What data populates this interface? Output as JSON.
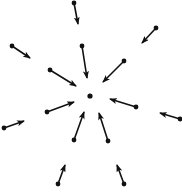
{
  "diagram": {
    "title": "",
    "colors": {
      "background": "#ffffff",
      "stroke": "#111111"
    },
    "center": {
      "x": 90,
      "y": 96,
      "r": 2.6
    },
    "arrows": [
      {
        "id": "top",
        "x1": 74,
        "y1": 3,
        "x2": 78,
        "y2": 24
      },
      {
        "id": "upper-left-outer",
        "x1": 12,
        "y1": 46,
        "x2": 30,
        "y2": 58
      },
      {
        "id": "upper-right-outer",
        "x1": 156,
        "y1": 28,
        "x2": 142,
        "y2": 43
      },
      {
        "id": "upper-inner",
        "x1": 82,
        "y1": 46,
        "x2": 87,
        "y2": 78
      },
      {
        "id": "upper-left-inner",
        "x1": 50,
        "y1": 70,
        "x2": 76,
        "y2": 86
      },
      {
        "id": "upper-right-inner",
        "x1": 124,
        "y1": 61,
        "x2": 103,
        "y2": 82
      },
      {
        "id": "right-inner",
        "x1": 136,
        "y1": 107,
        "x2": 110,
        "y2": 99
      },
      {
        "id": "right-outer",
        "x1": 180,
        "y1": 119,
        "x2": 160,
        "y2": 113
      },
      {
        "id": "left-inner",
        "x1": 47,
        "y1": 112,
        "x2": 74,
        "y2": 102
      },
      {
        "id": "left-outer",
        "x1": 4,
        "y1": 128,
        "x2": 24,
        "y2": 121
      },
      {
        "id": "lower-left-inner",
        "x1": 74,
        "y1": 140,
        "x2": 84,
        "y2": 112
      },
      {
        "id": "lower-right-inner",
        "x1": 108,
        "y1": 141,
        "x2": 99,
        "y2": 113
      },
      {
        "id": "bottom-left",
        "x1": 58,
        "y1": 184,
        "x2": 65,
        "y2": 165
      },
      {
        "id": "bottom-right",
        "x1": 124,
        "y1": 184,
        "x2": 117,
        "y2": 165
      }
    ]
  }
}
